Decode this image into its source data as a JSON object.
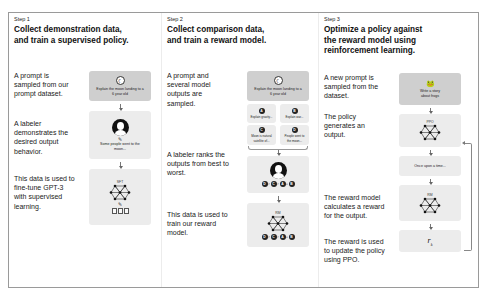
{
  "steps": [
    {
      "label": "Step 1",
      "title_lines": [
        "Collect demonstration data,",
        "and train a supervised policy."
      ],
      "descriptions": [
        "A prompt is sampled from our prompt dataset.",
        "A labeler demonstrates the desired output behavior.",
        "This data is used to fine-tune GPT-3 with supervised learning."
      ],
      "prompt_box": {
        "icon": "moon-icon",
        "text": "Explain the moon landing to a 6 year old"
      },
      "labeler_box": {
        "icon": "labeler-avatar-icon",
        "text": "Some people went to the moon..."
      },
      "model_box": {
        "label": "SFT",
        "icon": "neural-network-icon",
        "docs_icon": "documents-icon"
      }
    },
    {
      "label": "Step 2",
      "title_lines": [
        "Collect comparison data,",
        "and train a reward model."
      ],
      "descriptions": [
        "A prompt and several model outputs are sampled.",
        "A labeler ranks the outputs from best to worst.",
        "This data is used to train our reward model."
      ],
      "prompt_box": {
        "icon": "moon-icon",
        "text": "Explain the moon landing to a 6 year old"
      },
      "outputs": [
        {
          "letter": "A",
          "text": "Explain gravity..."
        },
        {
          "letter": "B",
          "text": "Explain war..."
        },
        {
          "letter": "C",
          "text": "Moon is natural satellite of..."
        },
        {
          "letter": "D",
          "text": "People went to the moon..."
        }
      ],
      "ranking": [
        "D",
        "C",
        "A",
        "B"
      ],
      "ranking_separators": [
        ">",
        ">",
        "="
      ],
      "model_box": {
        "label": "RM",
        "icon": "neural-network-icon"
      }
    },
    {
      "label": "Step 3",
      "title_lines": [
        "Optimize a policy against",
        "the reward model using",
        "reinforcement learning."
      ],
      "descriptions": [
        "A new prompt is sampled from the dataset.",
        "The policy generates an output.",
        "The reward model calculates a reward for the output.",
        "The reward is used to update the policy using PPO."
      ],
      "prompt_box": {
        "icon": "frog-icon",
        "text": "Write a story about frogs"
      },
      "policy_box": {
        "label": "PPO",
        "icon": "neural-network-icon"
      },
      "output_box": {
        "text": "Once upon a time..."
      },
      "reward_model_box": {
        "label": "RM",
        "icon": "neural-network-icon"
      },
      "reward_box": {
        "symbol": "r",
        "subscript": "k"
      }
    }
  ]
}
